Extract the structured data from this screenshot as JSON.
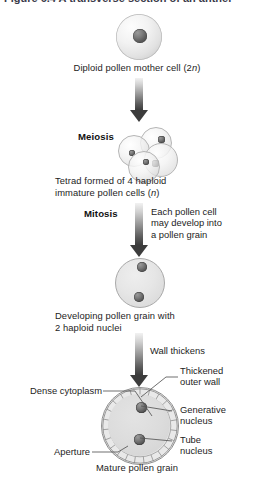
{
  "page": {
    "header_cutoff": "Figure 6.4  A transverse section of an anther"
  },
  "stages": {
    "s1": {
      "caption_pre": "Diploid pollen mother cell (2",
      "caption_italic": "n",
      "caption_post": ")",
      "caption_full": "Diploid pollen mother cell (2n)"
    },
    "s2": {
      "label": "Meiosis",
      "caption_line1": "Tetrad formed of 4 haploid",
      "caption_line2_pre": "immature pollen cells (",
      "caption_line2_italic": "n",
      "caption_line2_post": ")",
      "caption_full": "Tetrad formed of 4 haploid immature pollen cells (n)"
    },
    "s3": {
      "label": "Mitosis",
      "annot_line1": "Each pollen cell",
      "annot_line2": "may develop into",
      "annot_line3": "a pollen grain",
      "caption_line1": "Developing pollen grain with",
      "caption_line2": "2 haploid nuclei"
    },
    "s4": {
      "annot": "Wall thickens",
      "caption": "Mature pollen grain"
    }
  },
  "grain_labels": {
    "dense_cytoplasm": "Dense cytoplasm",
    "aperture": "Aperture",
    "thickened_outer_wall_line1": "Thickened",
    "thickened_outer_wall_line2": "outer wall",
    "generative_nucleus_line1": "Generative",
    "generative_nucleus_line2": "nucleus",
    "tube_nucleus_line1": "Tube",
    "tube_nucleus_line2": "nucleus"
  },
  "colors": {
    "background": "#ffffff",
    "text": "#1d1d1d",
    "arrow_dark": "#3c3c3c",
    "arrow_light": "#f2f2f2",
    "cell_fill": "#e0e0e0",
    "cell_stroke": "#9a9a9a",
    "nucleus_dark": "#4a4a4a",
    "leader_line": "#555555"
  }
}
